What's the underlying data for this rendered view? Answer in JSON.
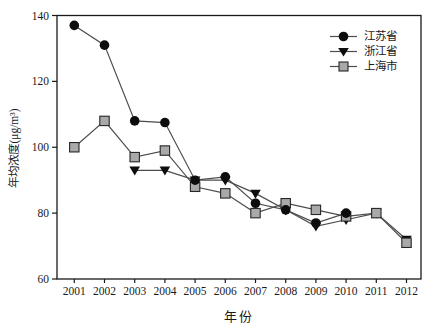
{
  "chart_data": {
    "type": "line",
    "title": "",
    "xlabel": "年份",
    "ylabel": "年均浓度(μg/m³)",
    "x_ticks": [
      2001,
      2002,
      2003,
      2004,
      2005,
      2006,
      2007,
      2008,
      2009,
      2010,
      2011,
      2012
    ],
    "y_ticks": [
      60,
      80,
      100,
      120,
      140
    ],
    "ylim": [
      60,
      140
    ],
    "xlim": [
      2000.45,
      2012.5
    ],
    "grid": false,
    "legend_position": "top-right",
    "frame": "full-box",
    "colors": {
      "line": "#4d4d4d",
      "axis": "#1a1a1a",
      "text": "#1a1a1a",
      "black_marker": "#0d0d0d",
      "square_fill": "#a9a9a9",
      "square_stroke": "#262626"
    },
    "series": [
      {
        "id": "jiangsu",
        "name": "江苏省",
        "marker": "circle",
        "x": [
          2001,
          2002,
          2003,
          2004,
          2005,
          2006,
          2007,
          2008,
          2009,
          2010
        ],
        "values": [
          137,
          131,
          108,
          107.5,
          90,
          91,
          83,
          81,
          77,
          80
        ]
      },
      {
        "id": "zhejiang",
        "name": "浙江省",
        "marker": "triangle-down",
        "x": [
          2003,
          2004,
          2005,
          2006,
          2007,
          2008,
          2009,
          2010,
          2011,
          2012
        ],
        "values": [
          93,
          93,
          90,
          90,
          86,
          81,
          76,
          78,
          80,
          72
        ]
      },
      {
        "id": "shanghai",
        "name": "上海市",
        "marker": "square",
        "x": [
          2001,
          2002,
          2003,
          2004,
          2005,
          2006,
          2007,
          2008,
          2009,
          2010,
          2011,
          2012
        ],
        "values": [
          100,
          108,
          97,
          99,
          88,
          86,
          80,
          83,
          81,
          79,
          80,
          71
        ]
      }
    ]
  }
}
